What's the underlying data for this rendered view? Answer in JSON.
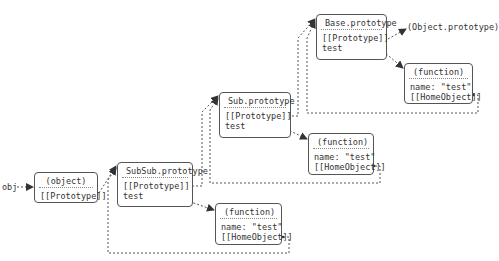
{
  "diagram": {
    "entry_label": "obj",
    "object_prototype_label": "(Object.prototype)",
    "nodes": {
      "obj": {
        "title": "(object)",
        "lines": [
          "[[Prototype]]"
        ]
      },
      "subsub": {
        "title": "SubSub.prototype",
        "lines": [
          "[[Prototype]]",
          "test"
        ]
      },
      "subsub_fn": {
        "title": "(function)",
        "lines": [
          "name: \"test\"",
          "[[HomeObject]]"
        ]
      },
      "sub": {
        "title": "Sub.prototype",
        "lines": [
          "[[Prototype]]",
          "test"
        ]
      },
      "sub_fn": {
        "title": "(function)",
        "lines": [
          "name: \"test\"",
          "[[HomeObject]]"
        ]
      },
      "base": {
        "title": "Base.prototype",
        "lines": [
          "[[Prototype]]",
          "test"
        ]
      },
      "base_fn": {
        "title": "(function)",
        "lines": [
          "name: \"test\"",
          "[[HomeObject]]"
        ]
      }
    },
    "edges": [
      {
        "from": "obj-label",
        "to": "obj"
      },
      {
        "from": "obj.[[Prototype]]",
        "to": "subsub"
      },
      {
        "from": "subsub.[[Prototype]]",
        "to": "sub"
      },
      {
        "from": "subsub.test",
        "to": "subsub_fn"
      },
      {
        "from": "subsub_fn.[[HomeObject]]",
        "to": "subsub"
      },
      {
        "from": "sub.[[Prototype]]",
        "to": "base"
      },
      {
        "from": "sub.test",
        "to": "sub_fn"
      },
      {
        "from": "sub_fn.[[HomeObject]]",
        "to": "sub"
      },
      {
        "from": "base.[[Prototype]]",
        "to": "(Object.prototype)"
      },
      {
        "from": "base.test",
        "to": "base_fn"
      },
      {
        "from": "base_fn.[[HomeObject]]",
        "to": "base"
      }
    ]
  }
}
